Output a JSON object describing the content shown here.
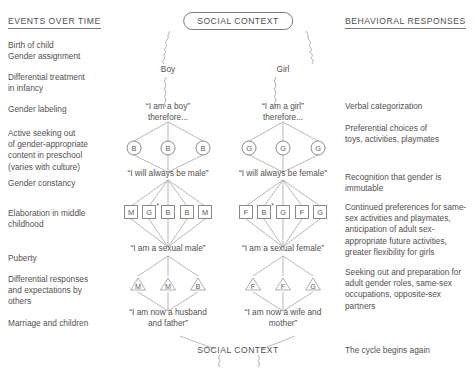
{
  "headings": {
    "left": "EVENTS OVER TIME",
    "right": "BEHAVIORAL RESPONSES"
  },
  "social_context": {
    "top_label": "SOCIAL CONTEXT",
    "bottom_label": "SOCIAL CONTEXT"
  },
  "left_column": [
    {
      "text": "Birth of child\nGender assignment",
      "top": 40
    },
    {
      "text": "Differential treatment\n  in infancy",
      "top": 72
    },
    {
      "text": "Gender labeling",
      "top": 104
    },
    {
      "text": "Active seeking out\n  of gender-appropriate\n  content in preschool\n  (varies with culture)",
      "top": 128
    },
    {
      "text": "Gender constancy",
      "top": 178
    },
    {
      "text": "Elaboration in middle\n  childhood",
      "top": 208
    },
    {
      "text": "Puberty",
      "top": 253
    },
    {
      "text": "Differential responses\n  and expectations by\n  others",
      "top": 274
    },
    {
      "text": "Marriage and  children",
      "top": 318
    }
  ],
  "right_column": [
    {
      "text": "Verbal categorization",
      "top": 101
    },
    {
      "text": "Preferential choices of\n  toys, activities, playmates",
      "top": 123
    },
    {
      "text": "Recognition that gender is\n  immutable",
      "top": 172
    },
    {
      "text": "Continued preferences for same-\n  sex activities and playmates,\n  anticipation of adult sex-\n  appropriate future activities,\n  greater flexibility for girls",
      "top": 202
    },
    {
      "text": "Seeking out and preparation for\n  adult gender roles, same-sex\n  occupations, opposite-sex\n  partners",
      "top": 267
    },
    {
      "text": "The cycle begins again",
      "top": 345
    }
  ],
  "boy_branch": {
    "top_label": "Boy",
    "statement_1": "“I am a boy”\ntherefore...",
    "statement_2": "“I will always be male”",
    "statement_3": "“I am a sexual male”",
    "statement_4": "“I am now a husband\nand father”",
    "circles": [
      "B",
      "B",
      "B"
    ],
    "squares": [
      {
        "label": "M",
        "star": false
      },
      {
        "label": "G",
        "star": true
      },
      {
        "label": "B",
        "star": false
      },
      {
        "label": "B",
        "star": false
      },
      {
        "label": "M",
        "star": false
      }
    ],
    "triangles": [
      "M",
      "M",
      "B"
    ]
  },
  "girl_branch": {
    "top_label": "Girl",
    "statement_1": "“I am a girl”\ntherefore...",
    "statement_2": "“I will always be female”",
    "statement_3": "“I am a sexual female”",
    "statement_4": "“I am now a wife and\nmother”",
    "circles": [
      "G",
      "G",
      "G"
    ],
    "squares": [
      {
        "label": "F",
        "star": false
      },
      {
        "label": "B",
        "star": true
      },
      {
        "label": "G",
        "star": false
      },
      {
        "label": "F",
        "star": false
      },
      {
        "label": "G",
        "star": false
      }
    ],
    "triangles": [
      "F",
      "F",
      "G"
    ]
  },
  "colors": {
    "ink": "#55504e",
    "line": "#8a8a8a",
    "rule": "#7a7a7a"
  }
}
